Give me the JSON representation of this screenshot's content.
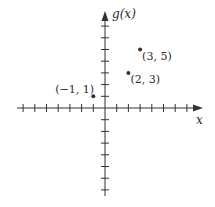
{
  "chart_data": {
    "type": "scatter",
    "title": "",
    "xlabel": "x",
    "ylabel": "g(x)",
    "xlim": [
      -7,
      7
    ],
    "ylim": [
      -7,
      8
    ],
    "grid": false,
    "tick_interval": 1,
    "points": [
      {
        "x": -1,
        "y": 1,
        "label": "(−1, 1)"
      },
      {
        "x": 2,
        "y": 3,
        "label": "(2, 3)"
      },
      {
        "x": 3,
        "y": 5,
        "label": "(3, 5)"
      }
    ]
  },
  "style": {
    "axis_color": "#333333",
    "point_color": "#333333"
  }
}
